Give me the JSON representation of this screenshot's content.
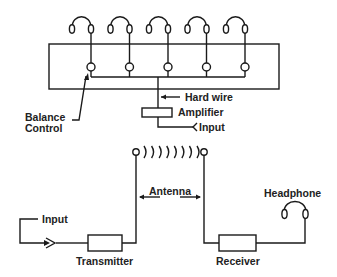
{
  "diagram": {
    "top_system": {
      "headphone_count": 5,
      "labels": {
        "balance_control_line1": "Balance",
        "balance_control_line2": "Control",
        "hard_wire": "Hard wire",
        "amplifier": "Amplifier",
        "input": "Input"
      }
    },
    "bottom_system": {
      "labels": {
        "antenna": "Antenna",
        "headphone": "Headphone",
        "input": "Input",
        "transmitter": "Transmitter",
        "receiver": "Receiver"
      }
    },
    "colors": {
      "ink": "#1a1a1a",
      "background": "#ffffff"
    }
  }
}
